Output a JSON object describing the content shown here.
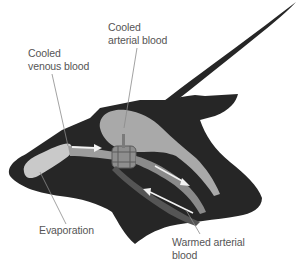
{
  "diagram": {
    "colors": {
      "silhouette": "#262626",
      "arterial_chamber": "#a9a9a9",
      "nasal_passage": "#c4c4c4",
      "vessel_dark": "#5a5a5a",
      "arrow": "#f2f2f2",
      "label_text": "#555555",
      "leader_line": "#8a8a8a"
    },
    "labels": {
      "cooled_arterial": {
        "line1": "Cooled",
        "line2": "arterial blood"
      },
      "cooled_venous": {
        "line1": "Cooled",
        "line2": "venous blood"
      },
      "evaporation": {
        "line1": "Evaporation"
      },
      "warmed_arterial": {
        "line1": "Warmed arterial",
        "line2": "blood"
      }
    },
    "arrows": [
      {
        "name": "venous-flow-arrow",
        "direction": "right"
      },
      {
        "name": "arterial-outflow-arrow",
        "direction": "down-right"
      },
      {
        "name": "warmed-arterial-inflow-arrow",
        "direction": "up-left"
      }
    ]
  }
}
